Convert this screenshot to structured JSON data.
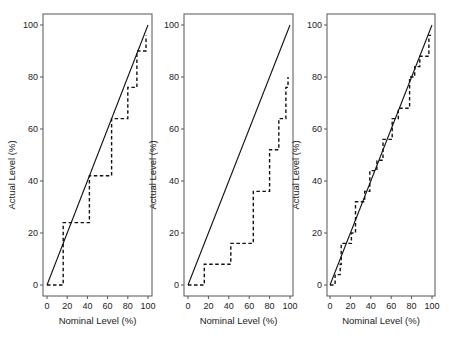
{
  "chart_data": [
    {
      "type": "line",
      "panel": 1,
      "xlabel": "Nominal Level (%)",
      "ylabel": "Actual Level (%)",
      "xlim": [
        0,
        100
      ],
      "ylim": [
        0,
        100
      ],
      "xticks": [
        0,
        20,
        40,
        60,
        80,
        100
      ],
      "yticks": [
        0,
        20,
        40,
        60,
        80,
        100
      ],
      "grid": false,
      "series": [
        {
          "name": "reference",
          "style": "solid",
          "x": [
            0,
            100
          ],
          "y": [
            0,
            100
          ]
        },
        {
          "name": "actual",
          "style": "dashed-step",
          "x": [
            0,
            14,
            16,
            41,
            42,
            63,
            64,
            79,
            80,
            88,
            89,
            95,
            98
          ],
          "y": [
            0,
            0,
            24,
            24,
            42,
            42,
            64,
            64,
            76,
            76,
            90,
            90,
            96
          ]
        }
      ]
    },
    {
      "type": "line",
      "panel": 2,
      "xlabel": "Nominal Level (%)",
      "ylabel": "Actual Level (%)",
      "xlim": [
        0,
        100
      ],
      "ylim": [
        0,
        100
      ],
      "xticks": [
        0,
        20,
        40,
        60,
        80,
        100
      ],
      "yticks": [
        0,
        20,
        40,
        60,
        80,
        100
      ],
      "grid": false,
      "series": [
        {
          "name": "reference",
          "style": "solid",
          "x": [
            0,
            100
          ],
          "y": [
            0,
            100
          ]
        },
        {
          "name": "actual",
          "style": "dashed-step",
          "x": [
            0,
            14,
            16,
            41,
            42,
            62,
            64,
            78,
            80,
            88,
            89,
            94,
            96,
            98
          ],
          "y": [
            0,
            0,
            8,
            8,
            16,
            16,
            36,
            36,
            52,
            52,
            64,
            64,
            76,
            80
          ]
        }
      ]
    },
    {
      "type": "line",
      "panel": 3,
      "xlabel": "Nominal Level (%)",
      "ylabel": "Actual Level (%)",
      "xlim": [
        0,
        100
      ],
      "ylim": [
        0,
        100
      ],
      "xticks": [
        0,
        20,
        40,
        60,
        80,
        100
      ],
      "yticks": [
        0,
        20,
        40,
        60,
        80,
        100
      ],
      "grid": false,
      "series": [
        {
          "name": "reference",
          "style": "solid",
          "x": [
            0,
            100
          ],
          "y": [
            0,
            100
          ]
        },
        {
          "name": "actual",
          "style": "dashed-step",
          "x": [
            0,
            3,
            5,
            8,
            10,
            11,
            15,
            16,
            20,
            21,
            24,
            25,
            28,
            32,
            34,
            38,
            39,
            42,
            44,
            46,
            48,
            51,
            52,
            57,
            60,
            61,
            65,
            67,
            72,
            76,
            78,
            80,
            83,
            84,
            88,
            90,
            96,
            97,
            99
          ],
          "y": [
            0,
            0,
            4,
            4,
            8,
            16,
            16,
            16,
            16,
            20,
            20,
            32,
            32,
            32,
            36,
            36,
            44,
            44,
            44,
            48,
            48,
            48,
            56,
            56,
            56,
            64,
            64,
            68,
            68,
            68,
            80,
            80,
            84,
            84,
            88,
            88,
            88,
            96,
            96
          ]
        }
      ]
    }
  ],
  "panels": [
    {
      "xlabel": "Nominal Level (%)",
      "ylabel": "Actual Level (%)",
      "xticks": [
        "0",
        "20",
        "40",
        "60",
        "80",
        "100"
      ],
      "yticks": [
        "0",
        "20",
        "40",
        "60",
        "80",
        "100"
      ]
    },
    {
      "xlabel": "Nominal Level (%)",
      "ylabel": "Actual Level (%)",
      "xticks": [
        "0",
        "20",
        "40",
        "60",
        "80",
        "100"
      ],
      "yticks": [
        "0",
        "20",
        "40",
        "60",
        "80",
        "100"
      ]
    },
    {
      "xlabel": "Nominal Level (%)",
      "ylabel": "Actual Level (%)",
      "xticks": [
        "0",
        "20",
        "40",
        "60",
        "80",
        "100"
      ],
      "yticks": [
        "0",
        "20",
        "40",
        "60",
        "80",
        "100"
      ]
    }
  ],
  "colors": {
    "line": "#111111",
    "frame": "#555555",
    "text": "#222222",
    "background": "#ffffff"
  }
}
